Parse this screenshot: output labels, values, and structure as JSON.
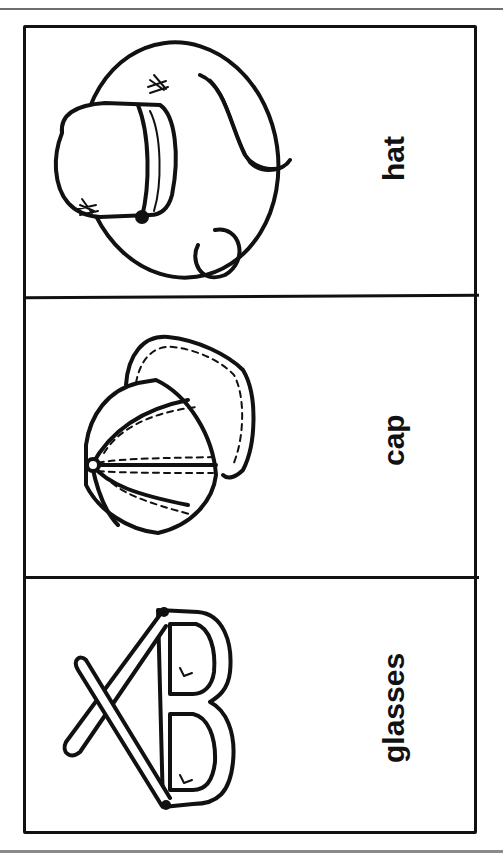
{
  "worksheet": {
    "panels": [
      {
        "label": "hat",
        "illustration": "hat-icon"
      },
      {
        "label": "cap",
        "illustration": "cap-icon"
      },
      {
        "label": "glasses",
        "illustration": "glasses-icon"
      }
    ]
  }
}
